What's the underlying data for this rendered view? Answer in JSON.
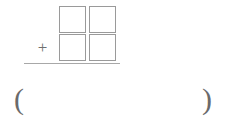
{
  "problem": {
    "type": "vertical-addition",
    "operator": "+",
    "addend_top": {
      "tens": "",
      "ones": ""
    },
    "addend_bottom": {
      "tens": "",
      "ones": ""
    },
    "answer": {
      "paren_open": "(",
      "paren_close": ")",
      "value": ""
    }
  },
  "colors": {
    "box_border": "#9a9a9a",
    "rule": "#a8a8a8",
    "glyph": "#6a6a6a",
    "background": "#ffffff"
  }
}
